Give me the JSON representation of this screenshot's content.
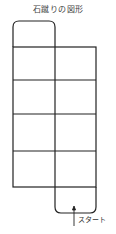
{
  "title": "石蹴りの図形",
  "diagram": {
    "type": "hopscotch-grid",
    "rows": 4,
    "columns": 2,
    "top_extension": "left-column rounded box",
    "bottom_extension": "right-column rounded box",
    "start_label": "スタート",
    "stroke_color": "#222222"
  }
}
